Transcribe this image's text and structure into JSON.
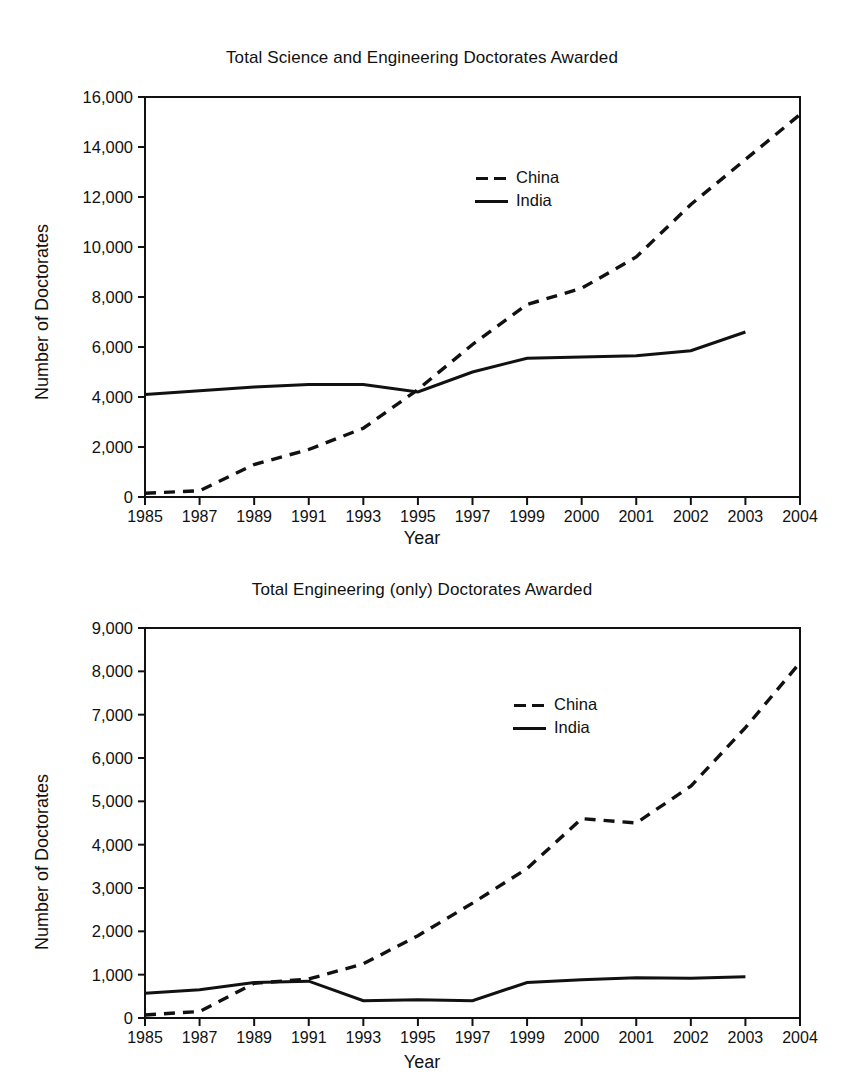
{
  "page": {
    "width": 844,
    "height": 1091,
    "background": "#ffffff",
    "ink_color": "#111111"
  },
  "chart_data": [
    {
      "type": "line",
      "title": "Total Science and Engineering Doctorates Awarded",
      "xlabel": "Year",
      "ylabel": "Number of Doctorates",
      "categories": [
        "1985",
        "1987",
        "1989",
        "1991",
        "1993",
        "1995",
        "1997",
        "1999",
        "2000",
        "2001",
        "2002",
        "2003",
        "2004"
      ],
      "x_tick_labels": [
        "1985",
        "1987",
        "1989",
        "1991",
        "1993",
        "1995",
        "1997",
        "1999",
        "2000",
        "2001",
        "2002",
        "2003",
        "2004"
      ],
      "y_tick_labels": [
        "0",
        "2,000",
        "4,000",
        "6,000",
        "8,000",
        "10,000",
        "12,000",
        "14,000",
        "16,000"
      ],
      "y_ticks": [
        0,
        2000,
        4000,
        6000,
        8000,
        10000,
        12000,
        14000,
        16000
      ],
      "ylim": [
        0,
        16000
      ],
      "grid": false,
      "legend_position": "upper-center",
      "series": [
        {
          "name": "China",
          "style": "dashed",
          "color": "#111111",
          "values": [
            150,
            250,
            1300,
            1900,
            2750,
            4300,
            6100,
            7700,
            8350,
            9600,
            11700,
            13500,
            15300
          ]
        },
        {
          "name": "India",
          "style": "solid",
          "color": "#111111",
          "values": [
            4100,
            4250,
            4400,
            4500,
            4500,
            4200,
            5000,
            5550,
            5600,
            5650,
            5850,
            6600,
            null
          ]
        }
      ]
    },
    {
      "type": "line",
      "title": "Total Engineering (only) Doctorates Awarded",
      "xlabel": "Year",
      "ylabel": "Number of Doctorates",
      "categories": [
        "1985",
        "1987",
        "1989",
        "1991",
        "1993",
        "1995",
        "1997",
        "1999",
        "2000",
        "2001",
        "2002",
        "2003",
        "2004"
      ],
      "x_tick_labels": [
        "1985",
        "1987",
        "1989",
        "1991",
        "1993",
        "1995",
        "1997",
        "1999",
        "2000",
        "2001",
        "2002",
        "2003",
        "2004"
      ],
      "y_tick_labels": [
        "0",
        "1,000",
        "2,000",
        "3,000",
        "4,000",
        "5,000",
        "6,000",
        "7,000",
        "8,000",
        "9,000"
      ],
      "y_ticks": [
        0,
        1000,
        2000,
        3000,
        4000,
        5000,
        6000,
        7000,
        8000,
        9000
      ],
      "ylim": [
        0,
        9000
      ],
      "grid": false,
      "legend_position": "upper-center",
      "series": [
        {
          "name": "China",
          "style": "dashed",
          "color": "#111111",
          "values": [
            70,
            150,
            800,
            900,
            1250,
            1900,
            2650,
            3450,
            4600,
            4500,
            5350,
            6700,
            8200
          ]
        },
        {
          "name": "India",
          "style": "solid",
          "color": "#111111",
          "values": [
            570,
            650,
            820,
            850,
            400,
            420,
            400,
            820,
            880,
            930,
            920,
            950,
            null
          ]
        }
      ]
    }
  ]
}
